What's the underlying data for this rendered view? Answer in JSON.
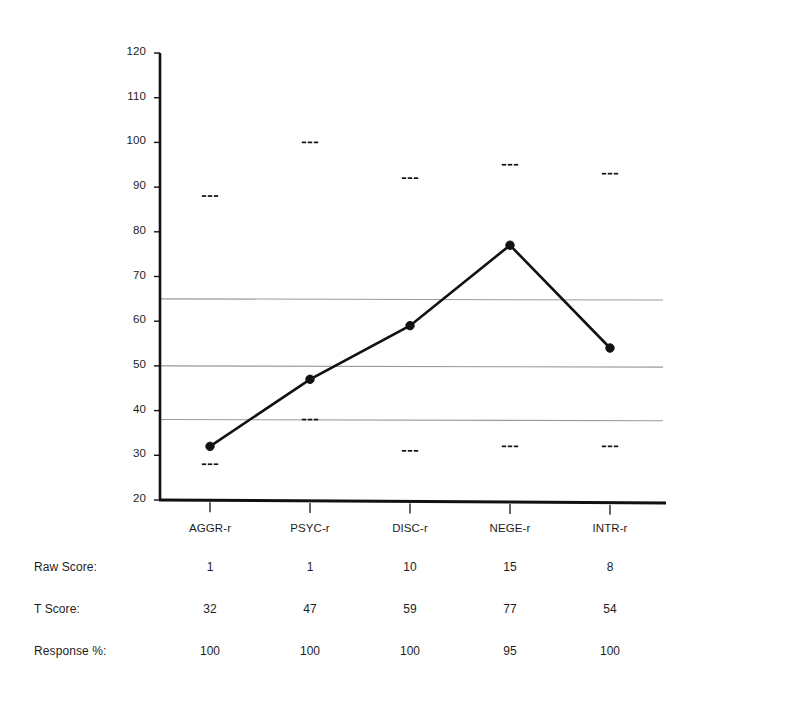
{
  "chart_data": {
    "type": "line",
    "title": "",
    "subtitle": "",
    "xlabel": "",
    "ylabel": "",
    "categories": [
      "AGGR-r",
      "PSYC-r",
      "DISC-r",
      "NEGE-r",
      "INTR-r"
    ],
    "series": [
      {
        "name": "T Score",
        "values": [
          32,
          47,
          59,
          77,
          54
        ],
        "marker": "filled-circle",
        "line_color": "#111111"
      },
      {
        "name": "Upper confidence marker",
        "values": [
          88,
          100,
          92,
          95,
          93
        ],
        "marker": "dashes",
        "line_color": "#111111"
      },
      {
        "name": "Lower confidence marker",
        "values": [
          28,
          38,
          31,
          32,
          32
        ],
        "marker": "dashes",
        "line_color": "#111111"
      }
    ],
    "ylim": [
      20,
      120
    ],
    "yticks": [
      20,
      30,
      40,
      50,
      60,
      70,
      80,
      90,
      100,
      110,
      120
    ],
    "ytick_labels": [
      "20",
      "30",
      "40",
      "50",
      "60",
      "70",
      "80",
      "90",
      "100",
      "110",
      "120"
    ],
    "gridlines": [
      65,
      50,
      38
    ],
    "grid": true,
    "legend": "none",
    "axis_color": "#111111",
    "grid_color": "#9a9a9a"
  },
  "table": {
    "rows": [
      {
        "label": "Raw Score:",
        "values": [
          "1",
          "1",
          "10",
          "15",
          "8"
        ]
      },
      {
        "label": "T Score:",
        "values": [
          "32",
          "47",
          "59",
          "77",
          "54"
        ]
      },
      {
        "label": "Response %:",
        "values": [
          "100",
          "100",
          "100",
          "95",
          "100"
        ]
      }
    ]
  }
}
